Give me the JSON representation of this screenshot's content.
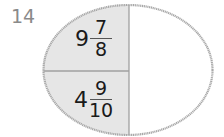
{
  "question": {
    "number": "14"
  },
  "diagram": {
    "shape": "ellipse",
    "colors": {
      "outline": "#a8a8a8",
      "shaded_fill": "#e6e6e6",
      "unshaded_fill": "#ffffff",
      "divider": "#a0a0a0",
      "text": "#1a1a1a",
      "question_number": "#8a8a8a"
    },
    "sections": [
      {
        "position": "top-left",
        "shaded": true,
        "value": {
          "whole": "9",
          "numerator": "7",
          "denominator": "8"
        }
      },
      {
        "position": "bottom-left",
        "shaded": true,
        "value": {
          "whole": "4",
          "numerator": "9",
          "denominator": "10"
        }
      },
      {
        "position": "right",
        "shaded": false,
        "value": {
          "whole": "",
          "numerator": "",
          "denominator": ""
        }
      }
    ]
  }
}
